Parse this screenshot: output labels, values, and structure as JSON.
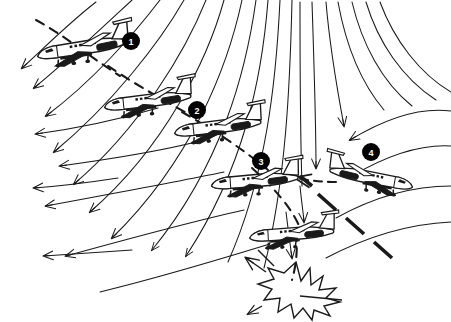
{
  "figure": {
    "background_color": "#ffffff",
    "ink_color": "#1a1a1a",
    "marker_fill": "#000000",
    "marker_text_color": "#ffffff",
    "dimensions": {
      "width": 451,
      "height": 322
    }
  },
  "markers": [
    {
      "id": "1",
      "label": "1",
      "x": 131,
      "y": 41,
      "r": 9
    },
    {
      "id": "2",
      "label": "2",
      "x": 197,
      "y": 110,
      "r": 9
    },
    {
      "id": "3",
      "label": "3",
      "x": 261,
      "y": 161,
      "r": 9
    },
    {
      "id": "4",
      "label": "4",
      "x": 371,
      "y": 152,
      "r": 9
    }
  ],
  "aircraft": [
    {
      "id": "aircraft-position-1",
      "x": 83,
      "y": 48,
      "scale": 1.0,
      "rotation": -8,
      "facing": "left"
    },
    {
      "id": "aircraft-position-2",
      "x": 148,
      "y": 101,
      "scale": 0.95,
      "rotation": -6,
      "facing": "left"
    },
    {
      "id": "aircraft-position-3",
      "x": 218,
      "y": 127,
      "scale": 0.95,
      "rotation": -6,
      "facing": "left"
    },
    {
      "id": "aircraft-position-4",
      "x": 255,
      "y": 181,
      "scale": 0.95,
      "rotation": -4,
      "facing": "left"
    },
    {
      "id": "aircraft-position-5",
      "x": 292,
      "y": 234,
      "scale": 0.92,
      "rotation": -3,
      "facing": "left"
    },
    {
      "id": "aircraft-position-6",
      "x": 371,
      "y": 178,
      "scale": 0.92,
      "rotation": -10,
      "facing": "right"
    }
  ],
  "impact": {
    "id": "crash-starburst",
    "x": 296,
    "y": 290,
    "label": "impact-burst"
  },
  "streamlines": {
    "description": "Curved downdraft / outflow streamlines of a microburst, arrowheads pointing left and down",
    "count": 22
  },
  "flight_path": {
    "description": "Dashed descending flight path through the microburst",
    "style": "dashed"
  }
}
